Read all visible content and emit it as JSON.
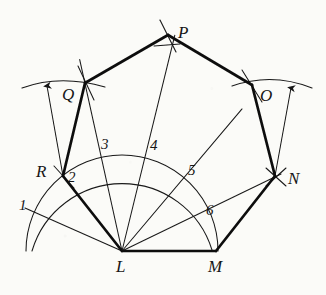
{
  "figure": {
    "kind": "geometric-construction",
    "ink_color": "#141414",
    "paper_color": "#fbfbf8"
  },
  "vertices": [
    {
      "id": "L",
      "label": "L",
      "x": 122,
      "y": 251,
      "label_x": 116,
      "label_y": 258
    },
    {
      "id": "M",
      "label": "M",
      "x": 216,
      "y": 251,
      "label_x": 208,
      "label_y": 258
    },
    {
      "id": "N",
      "label": "N",
      "x": 275,
      "y": 176,
      "label_x": 288,
      "label_y": 170
    },
    {
      "id": "O",
      "label": "O",
      "x": 252,
      "y": 85,
      "label_x": 260,
      "label_y": 87
    },
    {
      "id": "P",
      "label": "P",
      "x": 168,
      "y": 35,
      "label_x": 178,
      "label_y": 24
    },
    {
      "id": "Q",
      "label": "Q",
      "x": 85,
      "y": 83,
      "label_x": 62,
      "label_y": 86
    },
    {
      "id": "R",
      "label": "R",
      "x": 63,
      "y": 176,
      "label_x": 36,
      "label_y": 163
    }
  ],
  "division_labels": [
    {
      "label": "1",
      "x": 19,
      "y": 198
    },
    {
      "label": "2",
      "x": 68,
      "y": 170
    },
    {
      "label": "3",
      "x": 101,
      "y": 137
    },
    {
      "label": "4",
      "x": 150,
      "y": 138
    },
    {
      "label": "5",
      "x": 188,
      "y": 163
    },
    {
      "label": "6",
      "x": 206,
      "y": 203
    }
  ],
  "semicircle": {
    "center_x": 122,
    "center_y": 251,
    "radius": 96,
    "start_x": 26,
    "end_x": 218
  },
  "division_points": [
    {
      "n": 1,
      "x": 36,
      "y": 216
    },
    {
      "n": 2,
      "x": 63,
      "y": 176
    },
    {
      "n": 3,
      "x": 101,
      "y": 156
    },
    {
      "n": 4,
      "x": 145,
      "y": 157
    },
    {
      "n": 5,
      "x": 182,
      "y": 180
    },
    {
      "n": 6,
      "x": 205,
      "y": 219
    }
  ],
  "polygon_sides": [
    {
      "from": "L",
      "to": "M"
    },
    {
      "from": "M",
      "to": "N"
    },
    {
      "from": "N",
      "to": "O"
    },
    {
      "from": "O",
      "to": "P"
    },
    {
      "from": "P",
      "to": "Q"
    },
    {
      "from": "Q",
      "to": "R"
    },
    {
      "from": "R",
      "to": "L"
    }
  ],
  "fan_lines": [
    {
      "from": "L",
      "to_division": 1
    },
    {
      "from": "L",
      "to_division": 2
    },
    {
      "from": "L",
      "to_division": 3
    },
    {
      "from": "L",
      "to_division": 4
    },
    {
      "from": "L",
      "to_division": 5
    },
    {
      "from": "L",
      "to_division": 6
    }
  ],
  "diagonals": [
    {
      "from": "L",
      "to": "Q",
      "note": "thin construction ray through division 3"
    },
    {
      "from": "L",
      "to": "P",
      "note": "thin construction ray through division 4"
    },
    {
      "from": "L",
      "to": "O",
      "note": "thin construction ray through division 5"
    },
    {
      "from": "L",
      "to": "N",
      "note": "thin construction ray through division 6"
    }
  ],
  "construction_arcs": [
    {
      "name": "arc-from-R",
      "center": "R",
      "note": "arc swung from R locating Q"
    },
    {
      "name": "arc-from-N",
      "center": "N",
      "note": "arc swung from N locating O"
    },
    {
      "name": "arc-from-M",
      "center": "M",
      "note": "arc swung from M through division 5"
    }
  ],
  "radius_arrows": [
    {
      "name": "arrow-left",
      "from_x": 63,
      "from_y": 176,
      "to_x": 47,
      "to_y": 86
    },
    {
      "name": "arrow-right",
      "from_x": 275,
      "from_y": 176,
      "to_x": 291,
      "to_y": 88
    }
  ]
}
